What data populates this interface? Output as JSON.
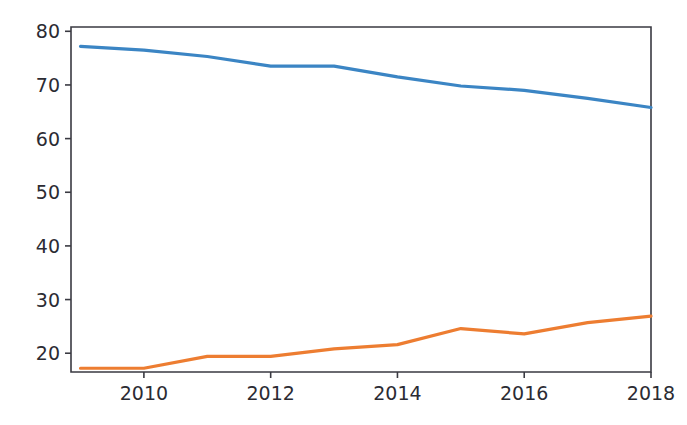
{
  "chart_data": {
    "type": "line",
    "title": "",
    "subtitle": "",
    "xlabel": "",
    "ylabel": "",
    "x": [
      2009,
      2010,
      2011,
      2012,
      2013,
      2014,
      2015,
      2016,
      2017,
      2018
    ],
    "xlim": [
      2008.85,
      2018.0
    ],
    "ylim": [
      16.5,
      80.8
    ],
    "xticks": [
      2010,
      2012,
      2014,
      2016,
      2018
    ],
    "xtick_labels": [
      "2010",
      "2012",
      "2014",
      "2016",
      "2018"
    ],
    "yticks": [
      20,
      30,
      40,
      50,
      60,
      70,
      80
    ],
    "ytick_labels": [
      "20",
      "30",
      "40",
      "50",
      "60",
      "70",
      "80"
    ],
    "grid": false,
    "legend": false,
    "legend_position": "none",
    "series": [
      {
        "name": "series-1",
        "color": "#3b85c4",
        "values": [
          77.2,
          76.5,
          75.3,
          73.5,
          73.5,
          71.5,
          69.8,
          69.0,
          67.5,
          65.8
        ]
      },
      {
        "name": "series-2",
        "color": "#ed7d31",
        "values": [
          17.2,
          17.2,
          19.4,
          19.4,
          20.8,
          21.6,
          24.6,
          23.6,
          25.7,
          26.9
        ]
      }
    ],
    "axes_geometry": {
      "left": 71,
      "right": 651,
      "top": 27,
      "bottom": 372
    },
    "style": {
      "background": "#ffffff",
      "axis_color": "#3a3a42",
      "tick_text_color": "#2b2b33"
    }
  }
}
